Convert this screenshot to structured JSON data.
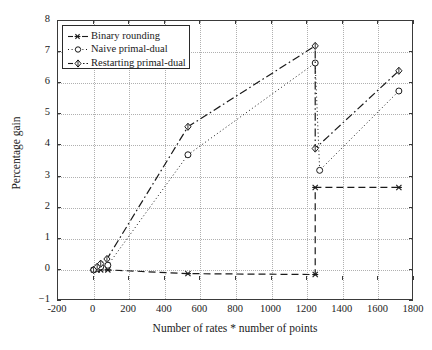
{
  "chart_data": {
    "type": "line",
    "title": "",
    "xlabel": "Number of rates * number of points",
    "ylabel": "Percentage gain",
    "xlim": [
      -200,
      1800
    ],
    "ylim": [
      -1,
      8
    ],
    "xticks": [
      -200,
      0,
      200,
      400,
      600,
      800,
      1000,
      1200,
      1400,
      1600,
      1800
    ],
    "yticks": [
      -1,
      0,
      1,
      2,
      3,
      4,
      5,
      6,
      7,
      8
    ],
    "grid": true,
    "legend_position": "top-left",
    "series": [
      {
        "name": "Binary rounding",
        "marker": "asterisk",
        "linestyle": "dashed",
        "color": "#1a1a1a",
        "points": [
          {
            "x": 0,
            "y": 0.0
          },
          {
            "x": 20,
            "y": 0.0
          },
          {
            "x": 40,
            "y": 0.0
          },
          {
            "x": 80,
            "y": 0.0
          },
          {
            "x": 530,
            "y": -0.12
          },
          {
            "x": 1245,
            "y": -0.15
          },
          {
            "x": 1245,
            "y": 2.65
          },
          {
            "x": 1715,
            "y": 2.65
          }
        ]
      },
      {
        "name": "Naive primal-dual",
        "marker": "circle",
        "linestyle": "dotted",
        "color": "#1a1a1a",
        "points": [
          {
            "x": 0,
            "y": 0.0
          },
          {
            "x": 20,
            "y": 0.05
          },
          {
            "x": 40,
            "y": 0.1
          },
          {
            "x": 80,
            "y": 0.15
          },
          {
            "x": 530,
            "y": 3.7
          },
          {
            "x": 1245,
            "y": 6.65
          },
          {
            "x": 1270,
            "y": 3.2
          },
          {
            "x": 1715,
            "y": 5.75
          }
        ]
      },
      {
        "name": "Restarting primal-dual",
        "marker": "diamond",
        "linestyle": "dash-dot",
        "color": "#1a1a1a",
        "points": [
          {
            "x": 0,
            "y": 0.0
          },
          {
            "x": 20,
            "y": 0.1
          },
          {
            "x": 40,
            "y": 0.2
          },
          {
            "x": 75,
            "y": 0.35
          },
          {
            "x": 530,
            "y": 4.6
          },
          {
            "x": 1245,
            "y": 7.2
          },
          {
            "x": 1245,
            "y": 3.9
          },
          {
            "x": 1715,
            "y": 6.4
          }
        ]
      }
    ]
  },
  "legend": {
    "items": [
      {
        "label": "Binary rounding"
      },
      {
        "label": "Naive primal-dual"
      },
      {
        "label": "Restarting primal-dual"
      }
    ]
  }
}
